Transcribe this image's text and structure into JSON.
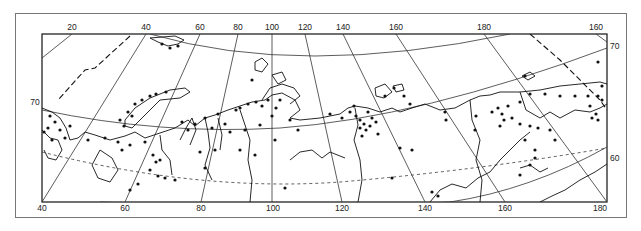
{
  "map": {
    "title": "",
    "projection": "conic",
    "region": "Northern Eurasia / Siberian Arctic",
    "top_longitude_labels": [
      {
        "text": "20",
        "x": 72,
        "y": 30
      },
      {
        "text": "40",
        "x": 146,
        "y": 30
      },
      {
        "text": "60",
        "x": 200,
        "y": 30
      },
      {
        "text": "80",
        "x": 238,
        "y": 30
      },
      {
        "text": "100",
        "x": 272,
        "y": 30
      },
      {
        "text": "120",
        "x": 305,
        "y": 30
      },
      {
        "text": "140",
        "x": 343,
        "y": 30
      },
      {
        "text": "160",
        "x": 396,
        "y": 30
      },
      {
        "text": "180",
        "x": 484,
        "y": 30
      },
      {
        "text": "160",
        "x": 596,
        "y": 30
      }
    ],
    "bottom_longitude_labels": [
      {
        "text": "40",
        "x": 42,
        "y": 209
      },
      {
        "text": "60",
        "x": 125,
        "y": 209
      },
      {
        "text": "80",
        "x": 201,
        "y": 209
      },
      {
        "text": "100",
        "x": 273,
        "y": 209
      },
      {
        "text": "120",
        "x": 342,
        "y": 209
      },
      {
        "text": "140",
        "x": 425,
        "y": 209
      },
      {
        "text": "160",
        "x": 505,
        "y": 209
      },
      {
        "text": "180",
        "x": 600,
        "y": 209
      }
    ],
    "latitude_labels": [
      {
        "text": "70",
        "x": 35,
        "y": 105
      },
      {
        "text": "70",
        "x": 614,
        "y": 49
      },
      {
        "text": "60",
        "x": 614,
        "y": 161
      }
    ],
    "colors": {
      "ink": "#111111",
      "grid": "#333333",
      "frame": "#777777",
      "background": "#ffffff"
    }
  }
}
